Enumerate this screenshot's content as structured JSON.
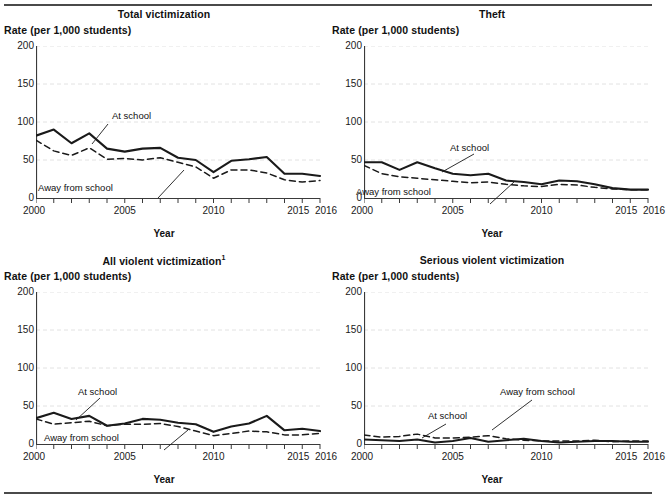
{
  "figure": {
    "y_axis_title": "Rate (per 1,000 students)",
    "x_axis_title": "Year",
    "series_labels": {
      "at_school": "At school",
      "away_from_school": "Away from school"
    },
    "y_ticks": [
      "0",
      "50",
      "100",
      "150",
      "200"
    ],
    "x_ticks": [
      "2000",
      "2005",
      "2010",
      "2015",
      "2016"
    ],
    "colors": {
      "at_school_line": "#1a1a1a",
      "away_line": "#1a1a1a",
      "axis": "#3a3a3a",
      "grid": "#e2e2e2",
      "rule": "#4a4a4a"
    }
  },
  "chart_data": [
    {
      "type": "line",
      "title": "Total victimization",
      "xlabel": "Year",
      "ylabel": "Rate (per 1,000 students)",
      "xlim": [
        2000,
        2016
      ],
      "ylim": [
        0,
        200
      ],
      "grid": true,
      "legend": "inline-annotations",
      "x": [
        2000,
        2001,
        2002,
        2003,
        2004,
        2005,
        2006,
        2007,
        2008,
        2009,
        2010,
        2011,
        2012,
        2013,
        2014,
        2015,
        2016
      ],
      "series": [
        {
          "name": "At school",
          "style": "solid",
          "values": [
            82,
            90,
            72,
            85,
            65,
            61,
            65,
            66,
            53,
            50,
            34,
            49,
            51,
            54,
            32,
            32,
            29
          ]
        },
        {
          "name": "Away from school",
          "style": "dashed",
          "values": [
            76,
            62,
            56,
            66,
            51,
            52,
            50,
            53,
            47,
            41,
            26,
            37,
            37,
            33,
            24,
            21,
            23
          ]
        }
      ]
    },
    {
      "type": "line",
      "title": "Theft",
      "xlabel": "Year",
      "ylabel": "Rate (per 1,000 students)",
      "xlim": [
        2000,
        2016
      ],
      "ylim": [
        0,
        200
      ],
      "grid": true,
      "legend": "inline-annotations",
      "x": [
        2000,
        2001,
        2002,
        2003,
        2004,
        2005,
        2006,
        2007,
        2008,
        2009,
        2010,
        2011,
        2012,
        2013,
        2014,
        2015,
        2016
      ],
      "series": [
        {
          "name": "At school",
          "style": "solid",
          "values": [
            47,
            47,
            37,
            47,
            39,
            32,
            30,
            32,
            23,
            21,
            18,
            23,
            22,
            18,
            13,
            11,
            11
          ]
        },
        {
          "name": "Away from school",
          "style": "dashed",
          "values": [
            43,
            32,
            28,
            26,
            24,
            22,
            20,
            21,
            18,
            16,
            15,
            18,
            17,
            14,
            12,
            11,
            11
          ]
        }
      ]
    },
    {
      "type": "line",
      "title": "All violent victimization",
      "title_footnote": "1",
      "xlabel": "Year",
      "ylabel": "Rate (per 1,000 students)",
      "xlim": [
        2000,
        2016
      ],
      "ylim": [
        0,
        200
      ],
      "grid": true,
      "legend": "inline-annotations",
      "x": [
        2000,
        2001,
        2002,
        2003,
        2004,
        2005,
        2006,
        2007,
        2008,
        2009,
        2010,
        2011,
        2012,
        2013,
        2014,
        2015,
        2016
      ],
      "series": [
        {
          "name": "At school",
          "style": "solid",
          "values": [
            34,
            41,
            33,
            37,
            24,
            27,
            33,
            32,
            28,
            26,
            16,
            23,
            27,
            37,
            18,
            20,
            17
          ]
        },
        {
          "name": "Away from school",
          "style": "dashed",
          "values": [
            33,
            26,
            28,
            30,
            24,
            26,
            26,
            27,
            23,
            17,
            11,
            14,
            17,
            16,
            12,
            12,
            14
          ]
        }
      ]
    },
    {
      "type": "line",
      "title": "Serious violent victimization",
      "xlabel": "Year",
      "ylabel": "Rate (per 1,000 students)",
      "xlim": [
        2000,
        2016
      ],
      "ylim": [
        0,
        200
      ],
      "grid": true,
      "legend": "inline-annotations",
      "x": [
        2000,
        2001,
        2002,
        2003,
        2004,
        2005,
        2006,
        2007,
        2008,
        2009,
        2010,
        2011,
        2012,
        2013,
        2014,
        2015,
        2016
      ],
      "series": [
        {
          "name": "At school",
          "style": "solid",
          "values": [
            6,
            5,
            4,
            6,
            2,
            4,
            8,
            3,
            5,
            7,
            4,
            2,
            3,
            4,
            4,
            3,
            3
          ]
        },
        {
          "name": "Away from school",
          "style": "dashed",
          "values": [
            12,
            9,
            10,
            13,
            8,
            8,
            9,
            11,
            7,
            5,
            4,
            4,
            4,
            5,
            3,
            4,
            4
          ]
        }
      ]
    }
  ],
  "panels": [
    {
      "key": "total",
      "title": "Total victimization",
      "footnote": "",
      "annotations": {
        "at_school": {
          "text": "At school",
          "x": 112,
          "y": 110
        },
        "away_school": {
          "text": "Away from school",
          "x": 38,
          "y": 182
        }
      }
    },
    {
      "key": "theft",
      "title": "Theft",
      "footnote": "",
      "annotations": {
        "at_school": {
          "text": "At school",
          "x": 122,
          "y": 142
        },
        "away_school": {
          "text": "Away from school",
          "x": 28,
          "y": 186
        }
      }
    },
    {
      "key": "all_violent",
      "title": "All violent victimization",
      "footnote": "1",
      "annotations": {
        "at_school": {
          "text": "At school",
          "x": 78,
          "y": 140
        },
        "away_school": {
          "text": "Away from school",
          "x": 44,
          "y": 186
        }
      }
    },
    {
      "key": "serious_violent",
      "title": "Serious violent victimization",
      "footnote": "",
      "annotations": {
        "at_school": {
          "text": "At school",
          "x": 100,
          "y": 164
        },
        "away_school": {
          "text": "Away from school",
          "x": 172,
          "y": 140
        }
      }
    }
  ]
}
